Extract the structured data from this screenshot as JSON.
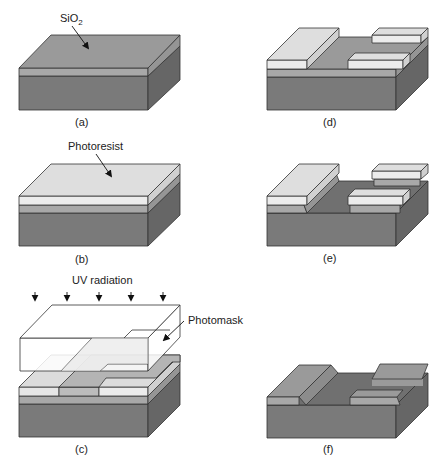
{
  "figure": {
    "panels": [
      {
        "id": "a",
        "caption": "(a)",
        "annotation": "SiO",
        "annotation_sub": "2"
      },
      {
        "id": "b",
        "caption": "(b)",
        "annotation": "Photoresist"
      },
      {
        "id": "c",
        "caption": "(c)",
        "annotation_top": "UV radiation",
        "annotation_side": "Photomask"
      },
      {
        "id": "d",
        "caption": "(d)"
      },
      {
        "id": "e",
        "caption": "(e)"
      },
      {
        "id": "f",
        "caption": "(f)"
      }
    ]
  },
  "colors": {
    "substrate_front": "#7a7a7a",
    "substrate_side": "#6a6a6a",
    "oxide_top": "#9a9a9a",
    "oxide_front": "#a8a8a8",
    "oxide_side": "#959595",
    "resist_top": "#dedede",
    "resist_front": "#ececec",
    "resist_side": "#d0d0d0",
    "exposed_top": "#b4b4b4",
    "mask": "#ffffff",
    "edge": "#333333"
  }
}
